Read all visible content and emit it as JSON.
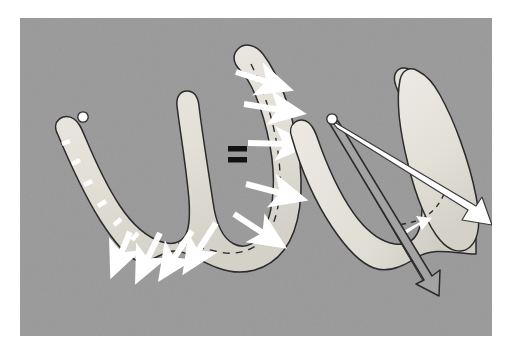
{
  "figure": {
    "kind": "scientific-diagram",
    "caption_text": "",
    "panel": {
      "background_color": "#9a9a9a",
      "border_color": "#ffffff",
      "x": 20,
      "y": 18,
      "width": 472,
      "height": 318
    },
    "palette": {
      "background_gray": "#9a9a9a",
      "shape_fill": "#e6e3dc",
      "shape_fill_shadow": "#d3d0c8",
      "outline": "#2b2b2b",
      "arrow_fill_white": "#ffffff",
      "arrow_outline": "#3a3a3a",
      "hollow_arrow_fill": "#a3a3a3",
      "dashed_line": "#2b2b2b",
      "equals_color": "#121212"
    },
    "operator": {
      "symbol": "=",
      "name": "equals-sign",
      "x": 228,
      "y": 148,
      "width": 18,
      "height": 14
    },
    "left_figure": {
      "label": "distributed-arrows-diagram",
      "description": "W shaped looped band with white arrows distributed along its right limb and basal curve",
      "dashed_centerline": true,
      "tick_marks_count": 7,
      "arrows_count": 9,
      "arrow_style": "filled-white",
      "knob_marker": true
    },
    "right_figure": {
      "label": "resultant-arrows-diagram",
      "description": "Same W shaped looped band with two long resultant arrows emanating from a single apex point",
      "dashed_centerline": true,
      "arrows": [
        {
          "name": "resultant-arrow-filled",
          "style": "filled-white",
          "direction": "down-right"
        },
        {
          "name": "resultant-arrow-hollow",
          "style": "outlined-hollow",
          "direction": "down-right-steep"
        }
      ],
      "knob_marker": true,
      "small_arrow_count": 1
    }
  }
}
